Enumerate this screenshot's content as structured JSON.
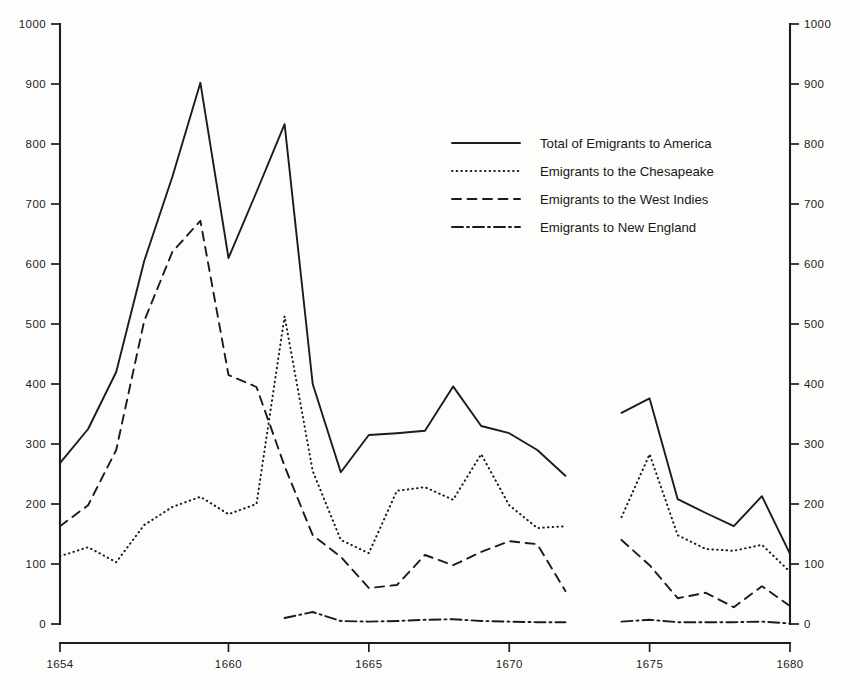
{
  "chart_data": {
    "type": "line",
    "title": "",
    "xlabel": "",
    "ylabel": "",
    "xlim": [
      1654,
      1680
    ],
    "ylim": [
      0,
      1000
    ],
    "grid": false,
    "legend_position": "upper-center-right",
    "x_ticks": [
      1654,
      1660,
      1665,
      1670,
      1675,
      1680
    ],
    "x_tick_labels": [
      "1654",
      "1660",
      "1665",
      "1670",
      "1675",
      "1680"
    ],
    "y_ticks": [
      0,
      100,
      200,
      300,
      400,
      500,
      600,
      700,
      800,
      900,
      1000
    ],
    "y_tick_labels": [
      "0",
      "100",
      "200",
      "300",
      "400",
      "500",
      "600",
      "700",
      "800",
      "900",
      "1000"
    ],
    "y_axis_right_mirrored": true,
    "note_gap_years": [
      1673
    ],
    "series": [
      {
        "name": "Total of Emigrants to America",
        "style": "solid",
        "x": [
          1654,
          1655,
          1656,
          1657,
          1658,
          1659,
          1660,
          1661,
          1662,
          1663,
          1664,
          1665,
          1666,
          1667,
          1668,
          1669,
          1670,
          1671,
          1672,
          1674,
          1675,
          1676,
          1677,
          1678,
          1679,
          1680
        ],
        "values": [
          268,
          325,
          420,
          605,
          745,
          902,
          610,
          720,
          833,
          400,
          253,
          315,
          318,
          322,
          396,
          330,
          318,
          290,
          247,
          352,
          376,
          208,
          185,
          163,
          213,
          117
        ]
      },
      {
        "name": "Emigrants to the Chesapeake",
        "style": "dotted",
        "x": [
          1654,
          1655,
          1656,
          1657,
          1658,
          1659,
          1660,
          1661,
          1662,
          1663,
          1664,
          1665,
          1666,
          1667,
          1668,
          1669,
          1670,
          1671,
          1672,
          1674,
          1675,
          1676,
          1677,
          1678,
          1679,
          1680
        ],
        "values": [
          113,
          128,
          103,
          165,
          195,
          212,
          183,
          200,
          513,
          255,
          140,
          118,
          222,
          228,
          207,
          283,
          198,
          160,
          163,
          178,
          283,
          148,
          125,
          122,
          132,
          87
        ]
      },
      {
        "name": "Emigrants to the West Indies",
        "style": "dashed",
        "x": [
          1654,
          1655,
          1656,
          1657,
          1658,
          1659,
          1660,
          1661,
          1662,
          1663,
          1664,
          1665,
          1666,
          1667,
          1668,
          1669,
          1670,
          1671,
          1672,
          1674,
          1675,
          1676,
          1677,
          1678,
          1679,
          1680
        ],
        "values": [
          163,
          198,
          290,
          505,
          620,
          672,
          415,
          395,
          263,
          148,
          112,
          60,
          65,
          115,
          98,
          120,
          138,
          133,
          55,
          140,
          98,
          43,
          52,
          28,
          63,
          30
        ]
      },
      {
        "name": "Emigrants to New England",
        "style": "dash-dot",
        "x": [
          1662,
          1663,
          1664,
          1665,
          1666,
          1667,
          1668,
          1669,
          1670,
          1671,
          1672,
          1674,
          1675,
          1676,
          1677,
          1678,
          1679,
          1680
        ],
        "values": [
          10,
          20,
          5,
          4,
          5,
          7,
          8,
          5,
          4,
          3,
          3,
          4,
          7,
          3,
          3,
          3,
          4,
          1
        ]
      }
    ]
  },
  "legend": {
    "entries": [
      {
        "label": "Total of Emigrants to America",
        "style": "solid"
      },
      {
        "label": "Emigrants to the Chesapeake",
        "style": "dotted"
      },
      {
        "label": "Emigrants to the West Indies",
        "style": "dashed"
      },
      {
        "label": "Emigrants to New England",
        "style": "dash-dot"
      }
    ]
  },
  "colors": {
    "ink": "#1b1b1b",
    "background": "#fdfdfc"
  }
}
